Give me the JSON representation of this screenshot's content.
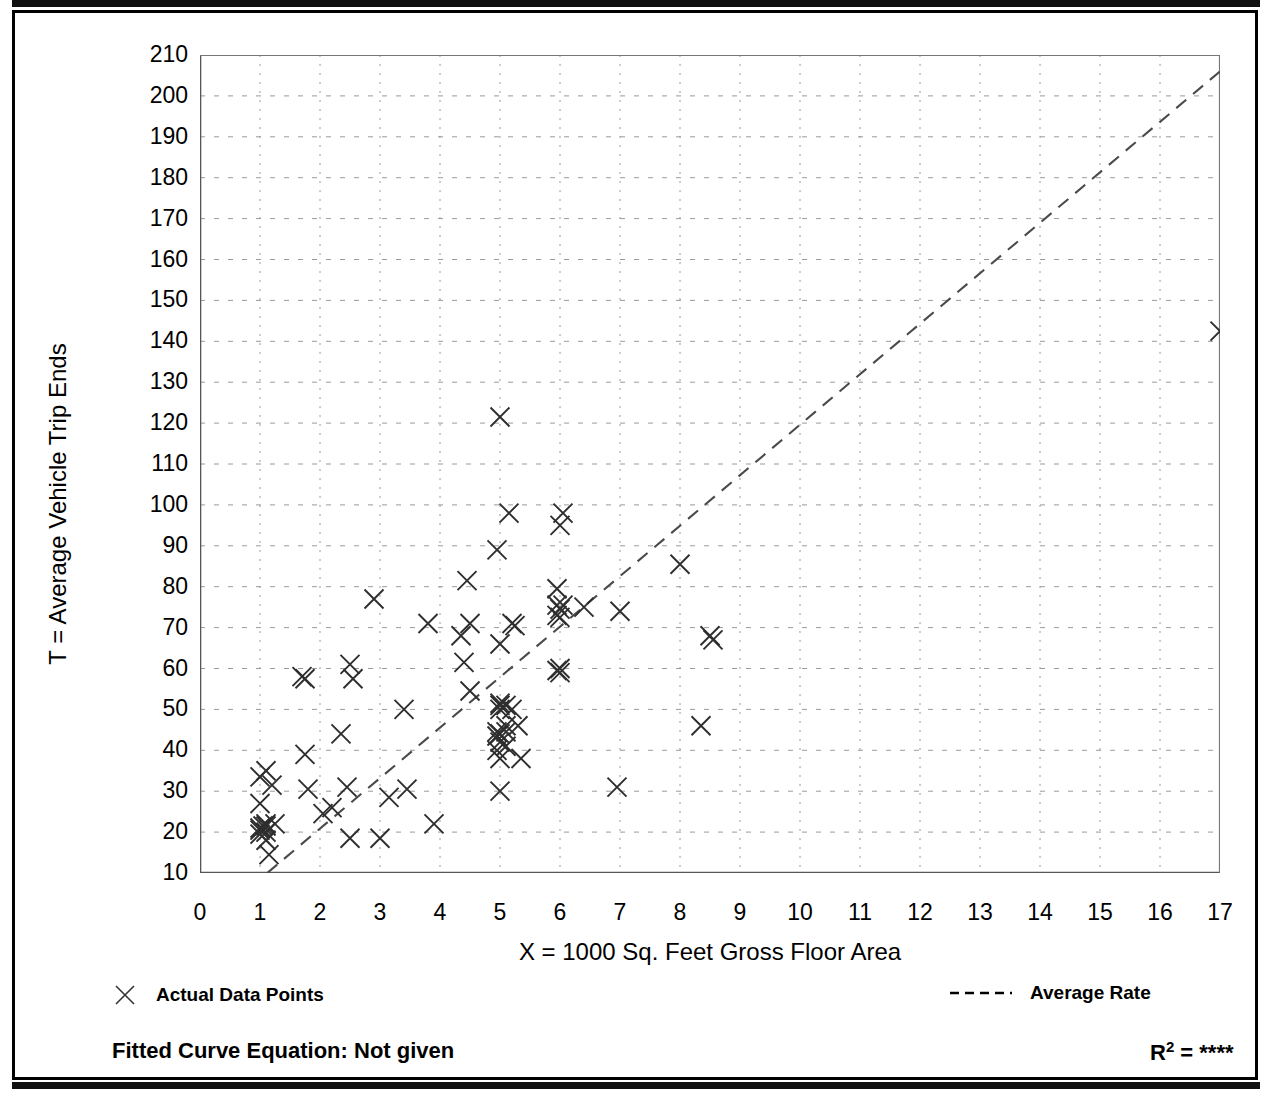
{
  "axes": {
    "y_title": "T = Average Vehicle Trip Ends",
    "x_title": "X = 1000 Sq. Feet Gross Floor Area",
    "y_ticks": [
      "210",
      "200",
      "190",
      "180",
      "170",
      "160",
      "150",
      "140",
      "130",
      "120",
      "110",
      "100",
      "90",
      "80",
      "70",
      "60",
      "50",
      "40",
      "30",
      "20",
      "10"
    ],
    "x_ticks": [
      "0",
      "1",
      "2",
      "3",
      "4",
      "5",
      "6",
      "7",
      "8",
      "9",
      "10",
      "11",
      "12",
      "13",
      "14",
      "15",
      "16",
      "17"
    ]
  },
  "legend": {
    "data_points_label": "Actual Data Points",
    "data_points_icon": "x-marker-icon",
    "average_rate_label": "Average Rate",
    "average_rate_icon": "dashed-line-icon"
  },
  "footer": {
    "fitted_curve_label": "Fitted Curve Equation:  Not given",
    "r_squared_label": "R",
    "r_squared_sup": "2",
    "r_squared_eq": " = ",
    "r_squared_value": "****"
  },
  "chart_data": {
    "type": "scatter",
    "title": "",
    "xlabel": "X = 1000 Sq. Feet Gross Floor Area",
    "ylabel": "T = Average Vehicle Trip Ends",
    "xlim": [
      0,
      17
    ],
    "ylim": [
      10,
      210
    ],
    "grid": true,
    "legend_position": "below-plot",
    "series": [
      {
        "name": "Actual Data Points",
        "type": "scatter",
        "marker": "x",
        "points": [
          [
            1.0,
            33.5
          ],
          [
            1.0,
            27.0
          ],
          [
            1.0,
            21.0
          ],
          [
            1.0,
            20.5
          ],
          [
            1.0,
            19.5
          ],
          [
            1.05,
            21.5
          ],
          [
            1.1,
            35.0
          ],
          [
            1.1,
            22.0
          ],
          [
            1.1,
            21.5
          ],
          [
            1.1,
            20.0
          ],
          [
            1.1,
            18.0
          ],
          [
            1.15,
            14.5
          ],
          [
            1.2,
            31.5
          ],
          [
            1.25,
            22.0
          ],
          [
            1.7,
            58.0
          ],
          [
            1.75,
            57.5
          ],
          [
            1.75,
            39.0
          ],
          [
            1.8,
            30.5
          ],
          [
            2.05,
            24.5
          ],
          [
            2.2,
            26.0
          ],
          [
            2.35,
            44.0
          ],
          [
            2.45,
            31.0
          ],
          [
            2.5,
            61.0
          ],
          [
            2.55,
            57.5
          ],
          [
            2.5,
            18.5
          ],
          [
            2.9,
            77.0
          ],
          [
            3.0,
            18.5
          ],
          [
            3.15,
            28.5
          ],
          [
            3.4,
            50.0
          ],
          [
            3.45,
            30.5
          ],
          [
            3.8,
            71.0
          ],
          [
            3.9,
            22.0
          ],
          [
            4.35,
            68.0
          ],
          [
            4.4,
            61.5
          ],
          [
            4.45,
            81.5
          ],
          [
            4.5,
            71.0
          ],
          [
            4.5,
            54.5
          ],
          [
            4.95,
            89.0
          ],
          [
            4.95,
            44.5
          ],
          [
            4.95,
            43.5
          ],
          [
            4.95,
            40.0
          ],
          [
            5.0,
            121.5
          ],
          [
            5.0,
            66.0
          ],
          [
            5.0,
            51.5
          ],
          [
            5.0,
            51.0
          ],
          [
            5.0,
            50.0
          ],
          [
            5.0,
            44.0
          ],
          [
            5.0,
            42.0
          ],
          [
            5.0,
            38.0
          ],
          [
            5.0,
            30.0
          ],
          [
            5.1,
            51.0
          ],
          [
            5.1,
            46.0
          ],
          [
            5.1,
            44.5
          ],
          [
            5.1,
            41.0
          ],
          [
            5.15,
            98.0
          ],
          [
            5.2,
            71.0
          ],
          [
            5.2,
            50.0
          ],
          [
            5.25,
            70.5
          ],
          [
            5.3,
            46.0
          ],
          [
            5.35,
            38.0
          ],
          [
            5.95,
            79.5
          ],
          [
            5.95,
            75.5
          ],
          [
            5.95,
            73.0
          ],
          [
            5.95,
            59.5
          ],
          [
            6.0,
            95.0
          ],
          [
            6.0,
            74.5
          ],
          [
            6.0,
            72.5
          ],
          [
            6.0,
            60.0
          ],
          [
            6.0,
            59.0
          ],
          [
            6.05,
            98.0
          ],
          [
            6.05,
            75.5
          ],
          [
            6.4,
            75.0
          ],
          [
            6.95,
            31.0
          ],
          [
            7.0,
            74.0
          ],
          [
            8.0,
            85.5
          ],
          [
            8.35,
            46.0
          ],
          [
            8.5,
            68.0
          ],
          [
            8.55,
            67.0
          ],
          [
            17.0,
            142.5
          ]
        ]
      },
      {
        "name": "Average Rate",
        "type": "line",
        "style": "dashed",
        "line_endpoints": [
          [
            1.12,
            10.0
          ],
          [
            17.0,
            206.0
          ]
        ]
      }
    ]
  }
}
